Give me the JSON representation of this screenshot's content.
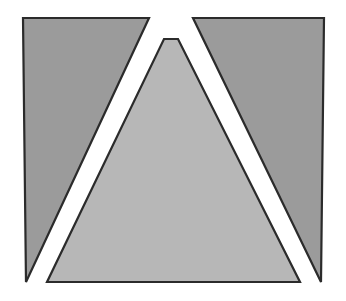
{
  "figure": {
    "canvas": {
      "width": 346,
      "height": 301,
      "background_color": "#ffffff"
    },
    "style": {
      "outline_color": "#2b2b2b",
      "outline_width": 2.2,
      "gap_color": "#ffffff",
      "wing_fill_color": "#9b9b9b",
      "center_fill_color": "#b7b7b7"
    },
    "shapes": [
      {
        "id": "left-wing",
        "label": "Left wing",
        "fill": "#9b9b9b",
        "stroke": "#2b2b2b",
        "points": "23,18 149,18 26,282"
      },
      {
        "id": "right-wing",
        "label": "Right wing",
        "fill": "#9b9b9b",
        "stroke": "#2b2b2b",
        "points": "193,18 324,18 321,282"
      },
      {
        "id": "center-triangle",
        "label": "Center truncated triangle",
        "fill": "#b7b7b7",
        "stroke": "#2b2b2b",
        "points": "164,39 178,39 300,282 47,282"
      }
    ]
  }
}
